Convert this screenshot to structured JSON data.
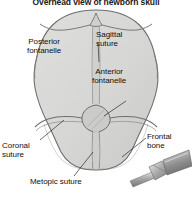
{
  "figure": {
    "title": "Overhead view of newborn skull",
    "background_color": "#ffffff",
    "skull_fill_color": "#d8d8d6",
    "skull_outline_color": "#6b6b6b",
    "suture_line_color": "#777777",
    "label_text_color": "#111111",
    "instrument_color": "#9a9a9a"
  },
  "labels": {
    "posterior_fontanelle": {
      "line1": "Posterior",
      "line2": "fontanelle",
      "name": "Posterior fontanelle"
    },
    "sagittal_suture": {
      "line1": "Sagittal",
      "line2": "suture",
      "name": "Sagittal suture"
    },
    "anterior_fontanelle": {
      "line1": "Anterior",
      "line2": "fontanelle",
      "name": "Anterior fontanelle"
    },
    "coronal_suture": {
      "line1": "Coronal",
      "line2": "suture",
      "name": "Coronal suture"
    },
    "metopic_suture": {
      "line1": "Metopic suture",
      "name": "Metopic suture"
    },
    "frontal_bone": {
      "line1": "Frontal",
      "line2": "bone",
      "name": "Frontal bone"
    }
  },
  "structures": [
    "skull outline",
    "posterior fontanelle",
    "sagittal suture",
    "anterior fontanelle",
    "coronal suture left",
    "coronal suture right",
    "metopic suture",
    "frontal bone left",
    "frontal bone right",
    "surgical instrument"
  ]
}
